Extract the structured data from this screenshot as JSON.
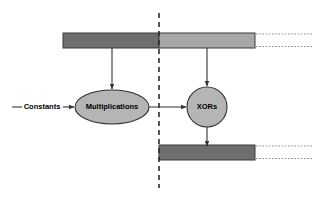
{
  "diagram": {
    "canvas": {
      "width": 314,
      "height": 199,
      "background": "#ffffff"
    },
    "colors": {
      "bar_dark": "#6e6e6e",
      "bar_light": "#a8a8a8",
      "node_fill": "#b5b5b5",
      "stroke": "#333333",
      "divider": "#2b2b2b",
      "dotted": "#999999"
    },
    "divider": {
      "name": "vertical-dashed-divider",
      "x": 159,
      "y_top": 13,
      "y_bottom": 188,
      "style": "dashed"
    },
    "bars": [
      {
        "name": "top-input-bar",
        "x": 63,
        "y": 33,
        "width": 192,
        "height": 15,
        "segments": [
          {
            "name": "top-bar-left-segment",
            "x": 63,
            "width": 96,
            "fill": "#6e6e6e"
          },
          {
            "name": "top-bar-right-segment",
            "x": 159,
            "width": 96,
            "fill": "#a8a8a8"
          }
        ],
        "continuation": {
          "name": "top-bar-dotted-continuation",
          "x_start": 256,
          "x_end": 312,
          "lines_y": [
            35,
            46
          ]
        }
      },
      {
        "name": "bottom-output-bar",
        "x": 159,
        "y": 145,
        "width": 96,
        "height": 15,
        "segments": [
          {
            "name": "bottom-bar-segment",
            "x": 159,
            "width": 96,
            "fill": "#6e6e6e"
          }
        ],
        "continuation": {
          "name": "bottom-bar-dotted-continuation",
          "x_start": 256,
          "x_end": 312,
          "lines_y": [
            147,
            158
          ]
        }
      }
    ],
    "nodes": [
      {
        "name": "multiplications-node",
        "shape": "ellipse",
        "label": "Multiplications",
        "cx": 112,
        "cy": 107,
        "rx": 37,
        "ry": 17,
        "font_size": 7.5
      },
      {
        "name": "xors-node",
        "shape": "circle",
        "label": "XORs",
        "cx": 207,
        "cy": 107,
        "rx": 20,
        "ry": 20,
        "font_size": 7.5
      }
    ],
    "edges": [
      {
        "name": "edge-top-bar-to-multiplications",
        "from": "top-input-bar",
        "to": "multiplications-node",
        "orientation": "vertical",
        "x1": 112,
        "y1": 48,
        "x2": 112,
        "y2": 89
      },
      {
        "name": "edge-top-bar-to-xors",
        "from": "top-input-bar",
        "to": "xors-node",
        "orientation": "vertical",
        "x1": 207,
        "y1": 48,
        "x2": 207,
        "y2": 86
      },
      {
        "name": "edge-multiplications-to-xors",
        "from": "multiplications-node",
        "to": "xors-node",
        "orientation": "horizontal",
        "x1": 149,
        "y1": 107,
        "x2": 186,
        "y2": 107
      },
      {
        "name": "edge-xors-to-bottom-bar",
        "from": "xors-node",
        "to": "bottom-output-bar",
        "orientation": "vertical",
        "x1": 207,
        "y1": 127,
        "x2": 207,
        "y2": 145
      },
      {
        "name": "edge-constants-to-multiplications",
        "from": "constants-source",
        "to": "multiplications-node",
        "orientation": "horizontal",
        "x1": 63,
        "y1": 107,
        "x2": 74,
        "y2": 107
      }
    ],
    "constants": {
      "name": "constants-input",
      "label": "Constants",
      "label_x": 39,
      "label_y": 107,
      "font_size": 7.5,
      "lead_line": {
        "x1": 12,
        "y1": 107,
        "x2": 22,
        "y2": 107
      }
    }
  }
}
